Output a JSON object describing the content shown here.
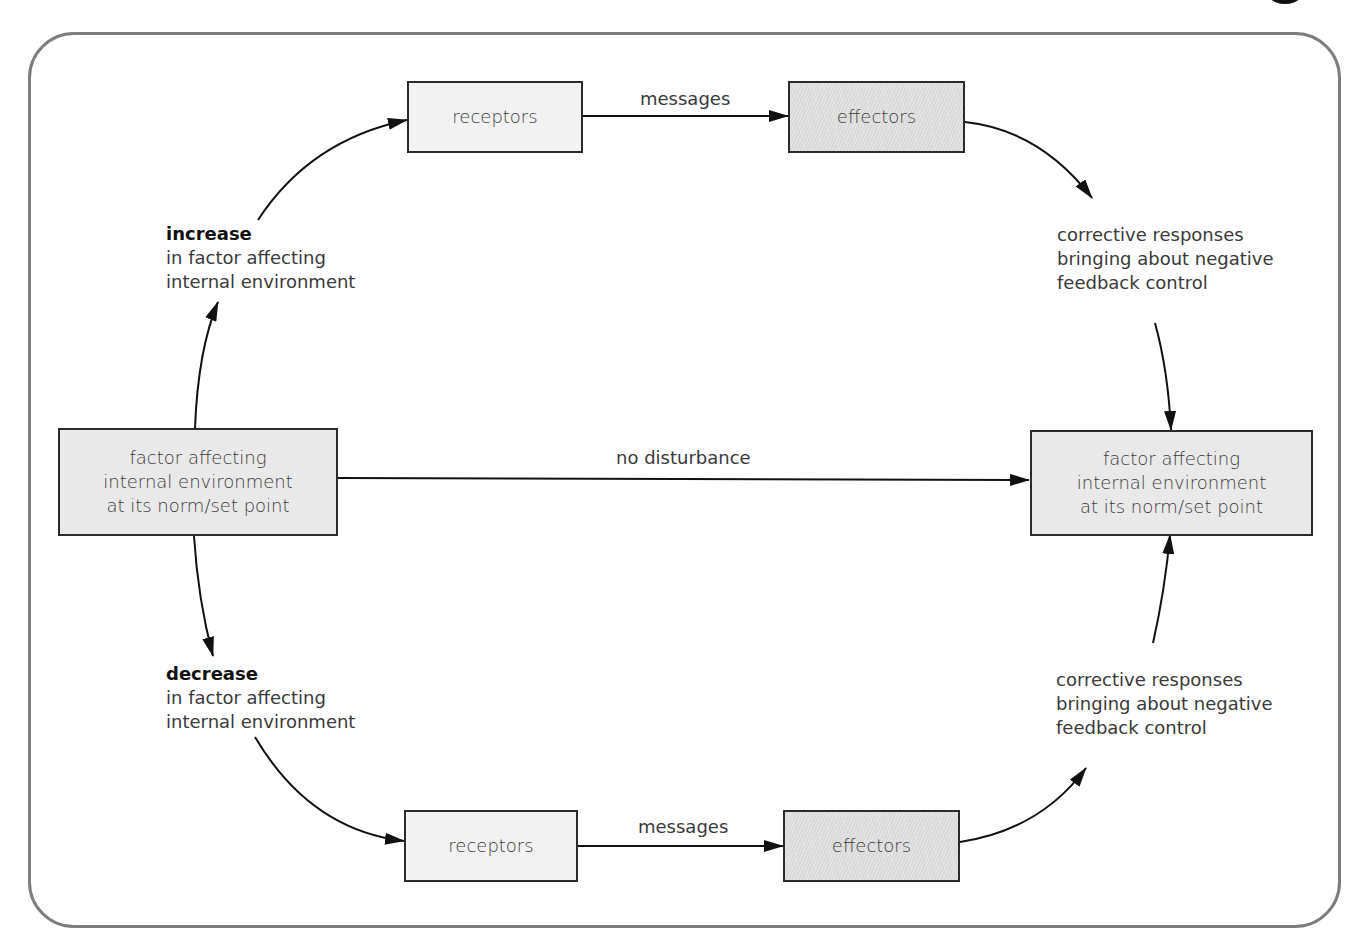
{
  "diagram": {
    "type": "flow",
    "title": "",
    "start_box": {
      "lines": [
        "factor affecting",
        "internal environment",
        "at its norm/set point"
      ]
    },
    "end_box": {
      "lines": [
        "factor affecting",
        "internal environment",
        "at its norm/set point"
      ]
    },
    "middle_link": {
      "label": "no disturbance"
    },
    "upper_path": {
      "trigger": {
        "heading": "increase",
        "lines": [
          "in factor affecting",
          "internal environment"
        ]
      },
      "receptors": "receptors",
      "link_label": "messages",
      "effectors": "effectors",
      "response": {
        "lines": [
          "corrective responses",
          "bringing about negative",
          "feedback control"
        ]
      }
    },
    "lower_path": {
      "trigger": {
        "heading": "decrease",
        "lines": [
          "in factor affecting",
          "internal environment"
        ]
      },
      "receptors": "receptors",
      "link_label": "messages",
      "effectors": "effectors",
      "response": {
        "lines": [
          "corrective responses",
          "bringing about negative",
          "feedback control"
        ]
      }
    },
    "colors": {
      "frame": "#7d7d7d",
      "box_border": "#2b2b2b",
      "receptor_fill": "#f2f2f2",
      "effector_fill": "#dadada",
      "factor_fill": "#e9e9e9",
      "arrow": "#111111"
    }
  }
}
